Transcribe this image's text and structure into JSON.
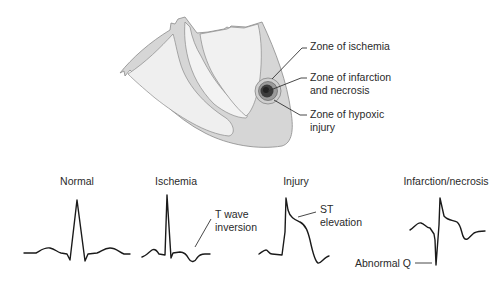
{
  "heart_diagram": {
    "colors": {
      "myocardium": "#d6d6d6",
      "chamber": "#ededed",
      "outline": "#8a8a8a",
      "ischemia_zone": "#c4c4c4",
      "injury_zone": "#7c7c7c",
      "infarction_zone": "#3a3a3a"
    },
    "labels": {
      "ischemia": "Zone of ischemia",
      "infarction_line1": "Zone of infarction",
      "infarction_line2": "and necrosis",
      "hypoxic_line1": "Zone of hypoxic",
      "hypoxic_line2": "injury"
    }
  },
  "ecg_panels": [
    {
      "title": "Normal"
    },
    {
      "title": "Ischemia",
      "annotation_line1": "T wave",
      "annotation_line2": "inversion"
    },
    {
      "title": "Injury",
      "annotation_line1": "ST",
      "annotation_line2": "elevation"
    },
    {
      "title": "Infarction/necrosis",
      "annotation": "Abnormal Q"
    }
  ],
  "style": {
    "trace_color": "#1a1a1a",
    "leader_color": "#333333"
  }
}
